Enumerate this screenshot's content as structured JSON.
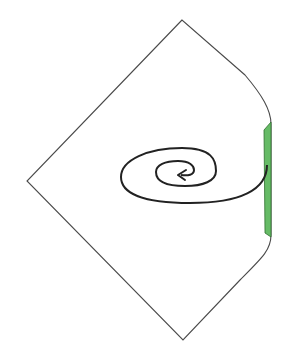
{
  "diagram": {
    "colors": {
      "outline": "#4a4a4a",
      "spiral": "#222222",
      "boundary_fill": "#66bb66",
      "boundary_stroke": "#2f6f2f",
      "background": "#ffffff"
    },
    "elements": [
      {
        "name": "diamond-outline",
        "kind": "region boundary"
      },
      {
        "name": "shaded-boundary-strip",
        "kind": "highlighted boundary"
      },
      {
        "name": "spiral-worldline",
        "kind": "trajectory with arrow"
      }
    ]
  }
}
